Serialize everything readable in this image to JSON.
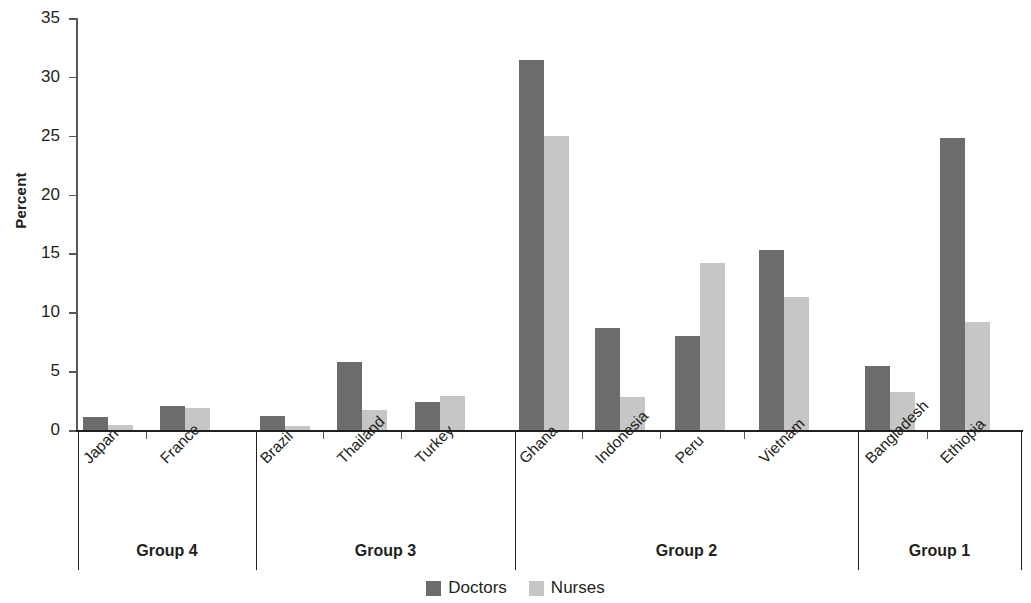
{
  "chart_data": {
    "type": "bar",
    "title": "",
    "xlabel": "",
    "ylabel": "Percent",
    "ylim": [
      0,
      35
    ],
    "yticks": [
      0,
      5,
      10,
      15,
      20,
      25,
      30,
      35
    ],
    "grid": false,
    "legend_position": "bottom-center",
    "categories": [
      "Japan",
      "France",
      "Brazil",
      "Thailand",
      "Turkey",
      "Ghana",
      "Indonesia",
      "Peru",
      "Vietnam",
      "Bangladesh",
      "Ethiopia"
    ],
    "series": [
      {
        "name": "Doctors",
        "color": "#6c6c6c",
        "values": [
          1.1,
          2.0,
          1.2,
          5.8,
          2.4,
          31.4,
          8.7,
          8.0,
          15.3,
          5.4,
          24.8
        ]
      },
      {
        "name": "Nurses",
        "color": "#c6c6c6",
        "values": [
          0.4,
          1.9,
          0.3,
          1.7,
          2.9,
          25.0,
          2.8,
          14.2,
          11.3,
          3.2,
          9.2
        ]
      }
    ],
    "groups": [
      {
        "label": "Group 4",
        "categories": [
          "Japan",
          "France"
        ]
      },
      {
        "label": "Group 3",
        "categories": [
          "Brazil",
          "Thailand",
          "Turkey"
        ]
      },
      {
        "label": "Group 2",
        "categories": [
          "Ghana",
          "Indonesia",
          "Peru",
          "Vietnam"
        ]
      },
      {
        "label": "Group 1",
        "categories": [
          "Bangladesh",
          "Ethiopia"
        ]
      }
    ]
  },
  "axis": {
    "y_label": "Percent",
    "y_tick_labels": [
      "0",
      "5",
      "10",
      "15",
      "20",
      "25",
      "30",
      "35"
    ]
  },
  "legend": {
    "items": [
      {
        "label": "Doctors",
        "color": "#6c6c6c"
      },
      {
        "label": "Nurses",
        "color": "#c6c6c6"
      }
    ]
  },
  "groups": [
    {
      "label": "Group 4"
    },
    {
      "label": "Group 3"
    },
    {
      "label": "Group 2"
    },
    {
      "label": "Group 1"
    }
  ],
  "categories": [
    {
      "label": "Japan"
    },
    {
      "label": "France"
    },
    {
      "label": "Brazil"
    },
    {
      "label": "Thailand"
    },
    {
      "label": "Turkey"
    },
    {
      "label": "Ghana"
    },
    {
      "label": "Indonesia"
    },
    {
      "label": "Peru"
    },
    {
      "label": "Vietnam"
    },
    {
      "label": "Bangladesh"
    },
    {
      "label": "Ethiopia"
    }
  ]
}
